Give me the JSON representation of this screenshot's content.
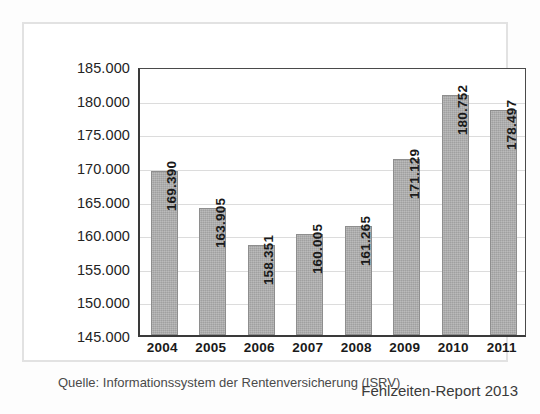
{
  "chart_data": {
    "type": "bar",
    "title": "",
    "subtitle": "",
    "xlabel": "",
    "ylabel": "",
    "categories": [
      "2004",
      "2005",
      "2006",
      "2007",
      "2008",
      "2009",
      "2010",
      "2011"
    ],
    "values": [
      169390,
      163905,
      158351,
      160005,
      161265,
      171129,
      180752,
      178497
    ],
    "value_labels": [
      "169.390",
      "163.905",
      "158.351",
      "160.005",
      "161.265",
      "171.129",
      "180.752",
      "178.497"
    ],
    "ylim": [
      145000,
      185000
    ],
    "ytick_labels": [
      "185.000",
      "180.000",
      "175.000",
      "170.000",
      "165.000",
      "160.000",
      "155.000",
      "150.000",
      "145.000"
    ],
    "ytick_values": [
      185000,
      180000,
      175000,
      170000,
      165000,
      160000,
      155000,
      150000,
      145000
    ],
    "grid": true,
    "legend": "none",
    "bar_color": "#ababab",
    "bar_border_color": "#8e8e8e",
    "gridline_color": "#dcdcdc",
    "axis_color": "#3a3a3a",
    "value_label_orientation": "vertical"
  },
  "notes": {
    "source": "Quelle: Informationssystem der Rentenversicherung (ISRV)",
    "report": "Fehlzeiten-Report 2013"
  }
}
